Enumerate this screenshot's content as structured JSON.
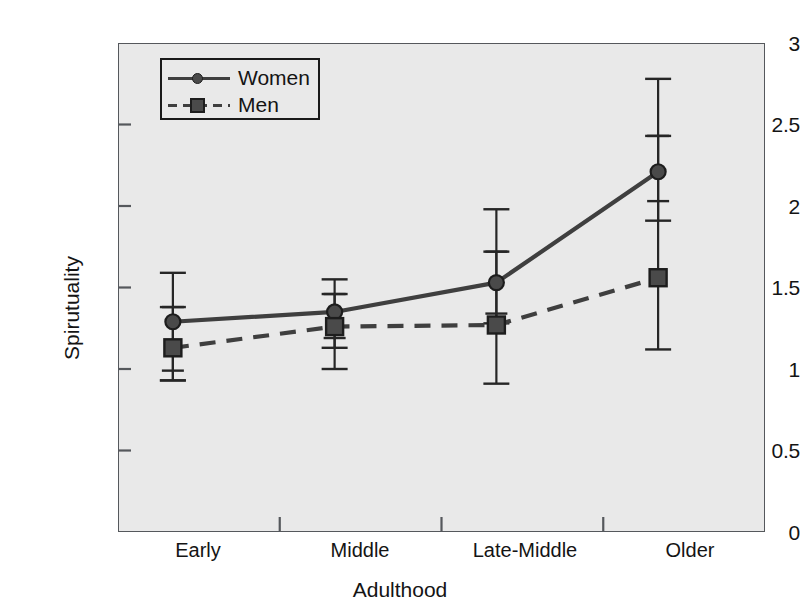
{
  "chart_data": {
    "type": "line",
    "title": "",
    "xlabel": "Adulthood",
    "ylabel": "Spirutuality",
    "categories": [
      "Early",
      "Middle",
      "Late-Middle",
      "Older"
    ],
    "ylim": [
      0,
      3
    ],
    "yticks": [
      "0",
      "0.5",
      "1",
      "1.5",
      "2",
      "2.5",
      "3"
    ],
    "ytick_values": [
      0,
      0.5,
      1,
      1.5,
      2,
      2.5,
      3
    ],
    "grid": false,
    "legend_position": "upper-left-inside",
    "error_bars": "asymmetric-with-inner-caps",
    "series": [
      {
        "name": "Women",
        "marker": "circle",
        "line_style": "solid",
        "color": "#3f3f3f",
        "values": [
          1.29,
          1.35,
          1.53,
          2.21
        ],
        "err_upper": [
          1.59,
          1.55,
          1.98,
          2.78
        ],
        "err_lower": [
          0.93,
          1.13,
          1.28,
          1.91
        ],
        "err_inner_upper": [
          1.38,
          1.46,
          1.72,
          2.43
        ],
        "err_inner_lower": [
          0.99,
          1.19,
          1.34,
          2.03
        ]
      },
      {
        "name": "Men",
        "marker": "square",
        "line_style": "dashed",
        "color": "#3f3f3f",
        "values": [
          1.13,
          1.26,
          1.27,
          1.56
        ],
        "err_upper": [
          1.38,
          1.46,
          1.72,
          2.43
        ],
        "err_lower": [
          0.93,
          1.0,
          0.91,
          1.12
        ],
        "err_inner_upper": [
          1.38,
          1.46,
          1.72,
          2.43
        ],
        "err_inner_lower": [
          0.99,
          1.19,
          1.34,
          2.03
        ]
      }
    ]
  },
  "legend": {
    "items": [
      {
        "label": "Women"
      },
      {
        "label": "Men"
      }
    ]
  },
  "colors": {
    "plot_background": "#e9e9e9",
    "axis": "#55585c",
    "series": "#3f3f3f",
    "marker_fill": "#4a4a4a",
    "text": "#141414",
    "page_background": "#ffffff"
  }
}
